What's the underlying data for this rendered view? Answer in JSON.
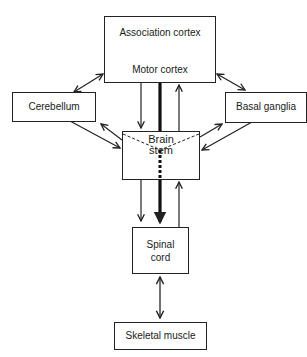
{
  "diagram": {
    "nodes": {
      "association_cortex": {
        "label": "Association cortex"
      },
      "motor_cortex": {
        "label": "Motor cortex"
      },
      "cerebellum": {
        "label": "Cerebellum"
      },
      "basal_ganglia": {
        "label": "Basal ganglia"
      },
      "brain_stem": {
        "label_line1": "Brain",
        "label_line2": "stem"
      },
      "spinal_cord": {
        "label_line1": "Spinal",
        "label_line2": "cord"
      },
      "skeletal_muscle": {
        "label": "Skeletal muscle"
      }
    },
    "edges": [
      {
        "from": "Association cortex",
        "to": "Motor cortex",
        "type": "bidirectional"
      },
      {
        "from": "Cortex",
        "to": "Cerebellum",
        "type": "bidirectional"
      },
      {
        "from": "Cortex",
        "to": "Basal ganglia",
        "type": "bidirectional"
      },
      {
        "from": "Cerebellum",
        "to": "Brain stem",
        "type": "one-way"
      },
      {
        "from": "Brain stem",
        "to": "Cerebellum",
        "type": "one-way"
      },
      {
        "from": "Basal ganglia",
        "to": "Brain stem",
        "type": "one-way"
      },
      {
        "from": "Brain stem",
        "to": "Basal ganglia",
        "type": "one-way"
      },
      {
        "from": "Motor cortex",
        "to": "Brain stem",
        "type": "one-way"
      },
      {
        "from": "Brain stem",
        "to": "Motor cortex",
        "type": "one-way"
      },
      {
        "from": "Motor cortex",
        "to": "Spinal cord",
        "type": "direct thick pathway"
      },
      {
        "from": "Brain stem",
        "to": "Spinal cord",
        "type": "one-way"
      },
      {
        "from": "Spinal cord",
        "to": "Brain stem",
        "type": "one-way"
      },
      {
        "from": "Spinal cord",
        "to": "Skeletal muscle",
        "type": "bidirectional"
      }
    ]
  }
}
